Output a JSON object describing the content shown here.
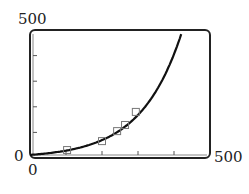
{
  "chart_data": {
    "type": "scatter",
    "title": "",
    "xlabel": "",
    "ylabel": "",
    "xlim": [
      0,
      500
    ],
    "ylim": [
      0,
      500
    ],
    "x_tick_interval": 100,
    "y_tick_interval": 100,
    "grid": false,
    "series": [
      {
        "name": "data points",
        "marker": "square",
        "x": [
          103,
          200,
          242,
          264,
          294
        ],
        "y": [
          31,
          66,
          105,
          129,
          180
        ]
      },
      {
        "name": "exponential fit",
        "style": "line",
        "x": [
          0,
          100,
          200,
          250,
          300,
          350,
          400,
          422
        ],
        "y": [
          12,
          28,
          64,
          98,
          160,
          270,
          420,
          492
        ]
      }
    ]
  },
  "labels": {
    "y_max": "500",
    "y_min": "0",
    "x_min": "0",
    "x_max": "500"
  }
}
